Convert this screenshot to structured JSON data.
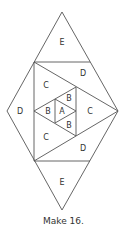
{
  "diagram": {
    "caption": "Make 16.",
    "labels": {
      "e_top": "E",
      "e_bottom": "E",
      "d_left": "D",
      "d_upper": "D",
      "d_lower": "D",
      "c_upper": "C",
      "c_lower": "C",
      "c_right": "C",
      "b_left": "B",
      "b_upper": "B",
      "b_lower": "B",
      "a_center": "A"
    },
    "colors": {
      "stroke": "#555555",
      "text": "#333333",
      "background": "#ffffff"
    }
  }
}
